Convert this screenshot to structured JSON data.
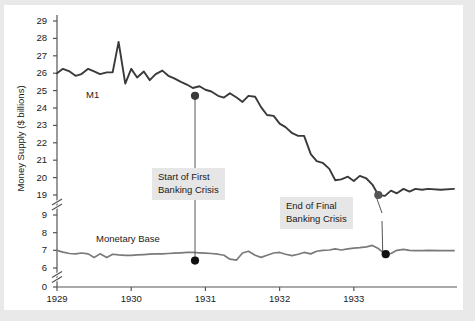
{
  "chart_data": {
    "type": "line",
    "title": "",
    "xlabel": "",
    "ylabel": "Money Supply ($ billions)",
    "grid": false,
    "legend_position": "inline-labels",
    "x_axis": {
      "tick_labels": [
        "1929",
        "1930",
        "1931",
        "1932",
        "1933"
      ],
      "tick_values": [
        1929,
        1930,
        1931,
        1932,
        1933
      ],
      "range": [
        1929.0,
        1934.35
      ]
    },
    "y_axis": {
      "broken": true,
      "tick_labels": [
        "29",
        "28",
        "27",
        "26",
        "25",
        "24",
        "23",
        "22",
        "21",
        "20",
        "19",
        "9",
        "8",
        "7",
        "6",
        "0"
      ],
      "upper_segment": {
        "ticks": [
          19,
          20,
          21,
          22,
          23,
          24,
          25,
          26,
          27,
          28,
          29
        ]
      },
      "lower_segment": {
        "ticks": [
          6,
          7,
          8,
          9
        ]
      },
      "zero_tick": 0
    },
    "series": [
      {
        "name": "M1",
        "color": "#3a3a3a",
        "label_text": "M1",
        "x": [
          1929.0,
          1929.08,
          1929.17,
          1929.25,
          1929.33,
          1929.42,
          1929.5,
          1929.58,
          1929.67,
          1929.75,
          1929.83,
          1929.92,
          1930.0,
          1930.08,
          1930.17,
          1930.25,
          1930.33,
          1930.42,
          1930.5,
          1930.58,
          1930.67,
          1930.75,
          1930.83,
          1930.92,
          1931.0,
          1931.08,
          1931.17,
          1931.25,
          1931.33,
          1931.42,
          1931.5,
          1931.58,
          1931.67,
          1931.75,
          1931.83,
          1931.92,
          1932.0,
          1932.08,
          1932.17,
          1932.25,
          1932.33,
          1932.42,
          1932.5,
          1932.58,
          1932.67,
          1932.75,
          1932.83,
          1932.92,
          1933.0,
          1933.08,
          1933.17,
          1933.25,
          1933.33,
          1933.42,
          1933.5,
          1933.58,
          1933.67,
          1933.75,
          1933.83,
          1933.92,
          1934.0,
          1934.17,
          1934.35
        ],
        "y": [
          26.0,
          26.25,
          26.1,
          25.85,
          25.95,
          26.25,
          26.1,
          25.95,
          26.05,
          26.05,
          27.8,
          25.4,
          26.25,
          25.75,
          26.1,
          25.6,
          25.95,
          26.15,
          25.85,
          25.7,
          25.5,
          25.35,
          25.15,
          25.25,
          25.05,
          24.95,
          24.7,
          24.6,
          24.85,
          24.6,
          24.35,
          24.7,
          24.65,
          24.05,
          23.6,
          23.55,
          23.1,
          22.9,
          22.55,
          22.4,
          22.4,
          21.35,
          20.95,
          20.85,
          20.5,
          19.85,
          19.9,
          20.05,
          19.8,
          20.1,
          19.95,
          19.6,
          19.0,
          18.95,
          19.25,
          19.1,
          19.35,
          19.2,
          19.35,
          19.3,
          19.35,
          19.3,
          19.35
        ],
        "markers": [
          {
            "x": 1930.86,
            "y": 24.7,
            "color": "#3a3a3a",
            "label": "Start of First Banking Crisis"
          },
          {
            "x": 1933.33,
            "y": 19.0,
            "color": "#555555",
            "label": "End of Final Banking Crisis"
          }
        ]
      },
      {
        "name": "Monetary Base",
        "color": "#7a7a7a",
        "label_text": "Monetary Base",
        "x": [
          1929.0,
          1929.08,
          1929.17,
          1929.25,
          1929.33,
          1929.42,
          1929.5,
          1929.58,
          1929.67,
          1929.75,
          1929.83,
          1929.92,
          1930.0,
          1930.08,
          1930.17,
          1930.25,
          1930.33,
          1930.42,
          1930.5,
          1930.58,
          1930.67,
          1930.75,
          1930.83,
          1930.92,
          1931.0,
          1931.08,
          1931.17,
          1931.25,
          1931.33,
          1931.42,
          1931.5,
          1931.58,
          1931.67,
          1931.75,
          1931.83,
          1931.92,
          1932.0,
          1932.08,
          1932.17,
          1932.25,
          1932.33,
          1932.42,
          1932.5,
          1932.58,
          1932.67,
          1932.75,
          1932.83,
          1932.92,
          1933.0,
          1933.08,
          1933.17,
          1933.25,
          1933.33,
          1933.42,
          1933.5,
          1933.58,
          1933.67,
          1933.75,
          1933.83,
          1933.92,
          1934.0,
          1934.17,
          1934.35
        ],
        "y": [
          7.0,
          6.9,
          6.82,
          6.8,
          6.85,
          6.8,
          6.6,
          6.8,
          6.6,
          6.78,
          6.74,
          6.72,
          6.72,
          6.74,
          6.76,
          6.78,
          6.8,
          6.8,
          6.82,
          6.84,
          6.86,
          6.88,
          6.88,
          6.86,
          6.84,
          6.82,
          6.78,
          6.72,
          6.5,
          6.45,
          6.85,
          6.95,
          6.72,
          6.6,
          6.72,
          6.85,
          6.88,
          6.78,
          6.7,
          6.78,
          6.88,
          6.8,
          6.95,
          7.0,
          7.02,
          7.08,
          7.02,
          7.08,
          7.12,
          7.15,
          7.2,
          7.28,
          7.1,
          6.78,
          6.82,
          7.0,
          7.05,
          7.0,
          6.98,
          6.98,
          7.0,
          6.98,
          6.98
        ],
        "markers": [
          {
            "x": 1930.86,
            "y": 6.42,
            "color": "#111111",
            "label": "Start of First Banking Crisis"
          },
          {
            "x": 1933.43,
            "y": 6.78,
            "color": "#111111",
            "label": "End of Final Banking Crisis"
          }
        ]
      }
    ],
    "annotations": [
      {
        "id": "start-first-banking-crisis",
        "line1": "Start of First",
        "line2": "Banking Crisis",
        "points_to": [
          "M1 1930.86",
          "Monetary Base 1930.86"
        ]
      },
      {
        "id": "end-final-banking-crisis",
        "line1": "End of Final",
        "line2": "Banking Crisis",
        "points_to": [
          "M1 1933.33",
          "Monetary Base 1933.43"
        ]
      }
    ]
  },
  "axis": {
    "y_title": "Money Supply ($ billions)",
    "y_ticks": [
      "29",
      "28",
      "27",
      "26",
      "25",
      "24",
      "23",
      "22",
      "21",
      "20",
      "19",
      "9",
      "8",
      "7",
      "6",
      "0"
    ],
    "x_ticks": [
      "1929",
      "1930",
      "1931",
      "1932",
      "1933"
    ]
  },
  "labels": {
    "m1": "M1",
    "monetary_base": "Monetary Base"
  },
  "annotations": {
    "start_crisis_line1": "Start of First",
    "start_crisis_line2": "Banking Crisis",
    "end_crisis_line1": "End of Final",
    "end_crisis_line2": "Banking Crisis"
  },
  "colors": {
    "m1_line": "#3a3a3a",
    "base_line": "#7a7a7a",
    "axis": "#555555",
    "annotation_bg": "#e6e6e6",
    "page_band": "#e9e9e9"
  }
}
